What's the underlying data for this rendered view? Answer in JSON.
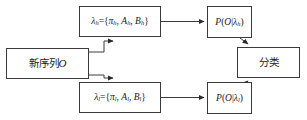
{
  "diagram": {
    "background_color": "#ffffff",
    "stroke_color": "#3a3a3a",
    "text_color": "#1a1a1a",
    "nodes": [
      {
        "id": "input",
        "name": "new-sequence-node",
        "text": "新序列O",
        "cjk": "新序列",
        "symbol": "O"
      },
      {
        "id": "model_high",
        "name": "model-high-node",
        "text": "λh={πh, Ah, Bh}",
        "lambda": "λ",
        "sub_h": "h",
        "equals": "={",
        "pi": "π",
        "comma1": ", ",
        "a": "A",
        "comma2": ", ",
        "b": "B",
        "close": "}"
      },
      {
        "id": "model_low",
        "name": "model-low-node",
        "text": "λl={πl, Al, Bl}",
        "lambda": "λ",
        "sub_l": "l",
        "equals": "={",
        "pi": "π",
        "comma1": ", ",
        "a": "A",
        "comma2": ", ",
        "b": "B",
        "close": "}"
      },
      {
        "id": "prob_high",
        "name": "probability-high-node",
        "text": "P(O|λh)",
        "p": "P",
        "open": "(",
        "o": "O",
        "bar": "|",
        "lambda": "λ",
        "sub": "h",
        "close": ")"
      },
      {
        "id": "prob_low",
        "name": "probability-low-node",
        "text": "P(O|λl)",
        "p": "P",
        "open": "(",
        "o": "O",
        "bar": "|",
        "lambda": "λ",
        "sub": "l",
        "close": ")"
      },
      {
        "id": "classify",
        "name": "classification-node",
        "text": "分类"
      }
    ],
    "edges": [
      {
        "id": "input-to-model-high",
        "from": "input",
        "to": "model_high",
        "style": "solid",
        "arrow": "single"
      },
      {
        "id": "input-to-model-low",
        "from": "input",
        "to": "model_low",
        "style": "solid",
        "arrow": "single"
      },
      {
        "id": "model-high-to-prob-high",
        "from": "model_high",
        "to": "prob_high",
        "style": "solid",
        "arrow": "single"
      },
      {
        "id": "model-low-to-prob-low",
        "from": "model_low",
        "to": "prob_low",
        "style": "solid",
        "arrow": "single"
      },
      {
        "id": "prob-high-to-classify",
        "from": "prob_high",
        "to": "classify",
        "style": "solid",
        "arrow": "single"
      },
      {
        "id": "prob-low-to-classify",
        "from": "prob_low",
        "to": "classify",
        "style": "solid",
        "arrow": "single"
      }
    ]
  }
}
